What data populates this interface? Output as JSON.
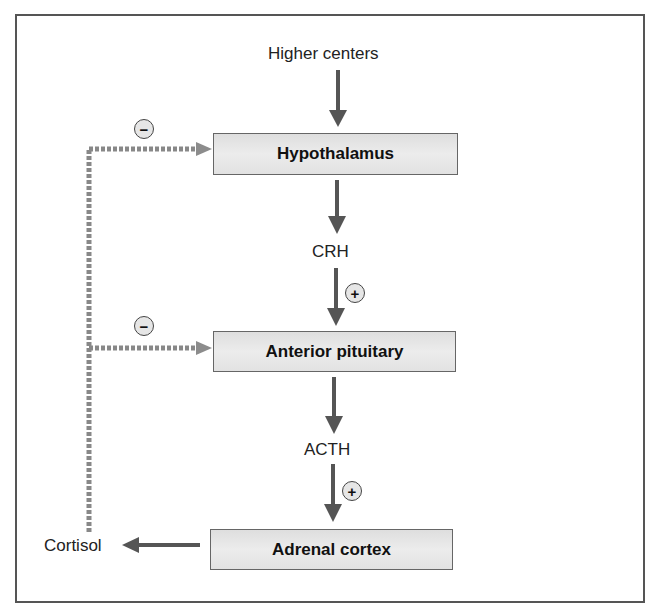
{
  "diagram": {
    "top_input": "Higher centers",
    "nodes": [
      {
        "id": "hypothalamus",
        "label": "Hypothalamus"
      },
      {
        "id": "anterior-pituitary",
        "label": "Anterior pituitary"
      },
      {
        "id": "adrenal-cortex",
        "label": "Adrenal cortex"
      }
    ],
    "hormones": {
      "crh": "CRH",
      "acth": "ACTH",
      "cortisol": "Cortisol"
    },
    "signs": {
      "positive": "+",
      "negative": "−"
    },
    "colors": {
      "arrow": "#555555",
      "feedback": "#8a8a8a",
      "box_fill": "#e4e4e4",
      "frame": "#555555"
    }
  }
}
